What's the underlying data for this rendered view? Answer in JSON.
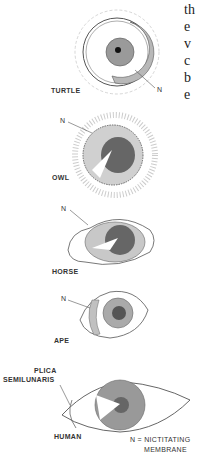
{
  "figure": {
    "panels": [
      {
        "id": "turtle",
        "label": "TURTLE",
        "pointer": "N"
      },
      {
        "id": "owl",
        "label": "OWL",
        "pointer": "N"
      },
      {
        "id": "horse",
        "label": "HORSE",
        "pointer": "N"
      },
      {
        "id": "ape",
        "label": "APE",
        "pointer": "N"
      },
      {
        "id": "human",
        "label": "HUMAN",
        "pointer": "PLICA SEMILUNARIS",
        "pointer_line1": "PLICA",
        "pointer_line2": "SEMILUNARIS"
      }
    ],
    "legend_line1": "N = NICTITATING",
    "legend_line2": "MEMBRANE"
  },
  "prose_fragments": [
    "th",
    "e",
    "v",
    "c",
    "b",
    "e"
  ]
}
